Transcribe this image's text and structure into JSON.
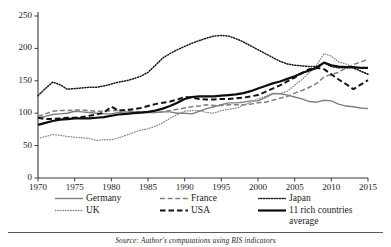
{
  "chart_data": {
    "type": "line",
    "title": "",
    "subtitle": "",
    "xlabel": "",
    "ylabel": "",
    "xlim": [
      1970,
      2015
    ],
    "ylim": [
      0,
      250
    ],
    "grid": false,
    "legend_position": "below",
    "xticks": [
      "1970",
      "1975",
      "1980",
      "1985",
      "1990",
      "1995",
      "2000",
      "2005",
      "2010",
      "2015"
    ],
    "yticks": [
      "0",
      "50",
      "100",
      "150",
      "200",
      "250"
    ],
    "x": [
      1970,
      1971,
      1972,
      1973,
      1974,
      1975,
      1976,
      1977,
      1978,
      1979,
      1980,
      1981,
      1982,
      1983,
      1984,
      1985,
      1986,
      1987,
      1988,
      1989,
      1990,
      1991,
      1992,
      1993,
      1994,
      1995,
      1996,
      1997,
      1998,
      1999,
      2000,
      2001,
      2002,
      2003,
      2004,
      2005,
      2006,
      2007,
      2008,
      2009,
      2010,
      2011,
      2012,
      2013,
      2014,
      2015
    ],
    "series": [
      {
        "name": "Germany",
        "style": "solid",
        "color": "#808080",
        "width": 1.4,
        "values": [
          93,
          95,
          98,
          99,
          100,
          103,
          102,
          101,
          100,
          99,
          99,
          101,
          102,
          102,
          101,
          101,
          101,
          102,
          102,
          100,
          100,
          99,
          103,
          107,
          110,
          113,
          116,
          116,
          117,
          119,
          119,
          124,
          130,
          130,
          128,
          125,
          122,
          118,
          117,
          120,
          119,
          114,
          111,
          110,
          108,
          107
        ]
      },
      {
        "name": "UK",
        "style": "fine-dotted",
        "color": "#8c8c8c",
        "width": 1.3,
        "values": [
          61,
          64,
          67,
          66,
          64,
          63,
          62,
          61,
          58,
          59,
          59,
          62,
          66,
          70,
          74,
          76,
          80,
          85,
          92,
          98,
          103,
          104,
          104,
          101,
          100,
          104,
          106,
          108,
          112,
          117,
          122,
          126,
          131,
          130,
          134,
          143,
          152,
          163,
          174,
          192,
          188,
          179,
          176,
          170,
          165,
          160
        ]
      },
      {
        "name": "France",
        "style": "dashed-gray",
        "color": "#808080",
        "width": 1.5,
        "values": [
          95,
          99,
          103,
          104,
          104,
          105,
          105,
          104,
          103,
          103,
          104,
          104,
          104,
          103,
          102,
          102,
          101,
          102,
          104,
          106,
          108,
          110,
          111,
          113,
          112,
          112,
          113,
          113,
          113,
          114,
          116,
          117,
          120,
          123,
          126,
          131,
          135,
          140,
          146,
          156,
          160,
          163,
          170,
          175,
          179,
          183
        ]
      },
      {
        "name": "USA",
        "style": "dashed-black",
        "color": "#141414",
        "width": 2.0,
        "values": [
          93,
          91,
          91,
          92,
          93,
          93,
          94,
          96,
          98,
          101,
          110,
          104,
          105,
          106,
          108,
          111,
          114,
          116,
          118,
          121,
          125,
          124,
          122,
          121,
          121,
          122,
          122,
          123,
          124,
          126,
          128,
          133,
          138,
          143,
          149,
          155,
          162,
          168,
          170,
          168,
          160,
          152,
          145,
          137,
          144,
          151
        ]
      },
      {
        "name": "Japan",
        "style": "dotted-black",
        "color": "#141414",
        "width": 1.5,
        "values": [
          127,
          138,
          148,
          144,
          137,
          138,
          139,
          140,
          140,
          142,
          145,
          148,
          150,
          153,
          157,
          163,
          174,
          185,
          192,
          198,
          203,
          208,
          212,
          216,
          219,
          220,
          219,
          215,
          210,
          204,
          198,
          192,
          186,
          180,
          176,
          174,
          173,
          172,
          172,
          178,
          172,
          170,
          170,
          170,
          165,
          160
        ]
      },
      {
        "name": "11 rich countries average",
        "style": "solid-black",
        "color": "#0d0d0d",
        "width": 2.2,
        "values": [
          82,
          85,
          88,
          90,
          91,
          92,
          92,
          92,
          93,
          94,
          96,
          98,
          99,
          100,
          101,
          102,
          104,
          107,
          111,
          116,
          122,
          125,
          126,
          126,
          126,
          127,
          128,
          129,
          131,
          134,
          138,
          142,
          146,
          149,
          153,
          157,
          162,
          166,
          170,
          178,
          174,
          172,
          171,
          171,
          170,
          170
        ]
      }
    ]
  },
  "legend": {
    "items": [
      {
        "label": "Germany",
        "style": "solid",
        "color": "#808080"
      },
      {
        "label": "France",
        "style": "dashed-gray",
        "color": "#808080"
      },
      {
        "label": "Japan",
        "style": "dotted-black",
        "color": "#141414"
      },
      {
        "label": "UK",
        "style": "fine-dotted",
        "color": "#8c8c8c"
      },
      {
        "label": "USA",
        "style": "dashed-black",
        "color": "#141414"
      },
      {
        "label": "11 rich countries",
        "label2": "average",
        "style": "solid-black",
        "color": "#0d0d0d"
      }
    ]
  },
  "footer": {
    "source": "Source: Author's computations using BIS indicators"
  }
}
